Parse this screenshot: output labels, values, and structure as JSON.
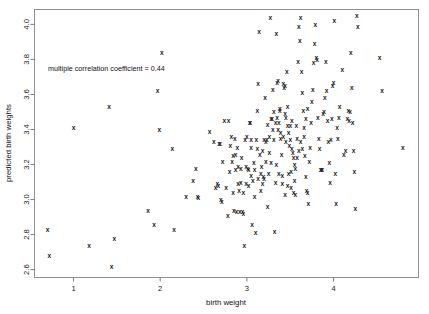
{
  "chart_data": {
    "type": "scatter",
    "title": "",
    "xlabel": "birth weight",
    "ylabel": "predicted birth weights",
    "xlim": [
      0.55,
      4.98
    ],
    "ylim": [
      2.555,
      4.085
    ],
    "xticks": [
      1,
      2,
      3,
      4
    ],
    "xtick_labels": [
      "1",
      "2",
      "3",
      "4"
    ],
    "yticks": [
      2.6,
      2.8,
      3.0,
      3.2,
      3.4,
      3.6,
      3.8,
      4.0
    ],
    "ytick_labels": [
      "2.6",
      "2.8",
      "3.0",
      "3.2",
      "3.4",
      "3.6",
      "3.8",
      "4.0"
    ],
    "grid": false,
    "legend": null,
    "marker": "x",
    "marker_color": "#1c1c1c",
    "frame_color": "#909090",
    "background": "#ffffff",
    "annotations": [
      {
        "text": "multiple correlation coefficient = 0.44",
        "x": 0.74,
        "y": 3.79,
        "align": "left"
      }
    ],
    "statistics": {
      "multiple_correlation_coefficient": 0.44,
      "n_points": 222
    },
    "points": [
      [
        0.7,
        2.83
      ],
      [
        0.72,
        2.68
      ],
      [
        1.0,
        3.41
      ],
      [
        1.18,
        2.74
      ],
      [
        1.41,
        3.53
      ],
      [
        1.44,
        2.62
      ],
      [
        1.47,
        2.78
      ],
      [
        1.86,
        2.94
      ],
      [
        1.93,
        2.86
      ],
      [
        1.97,
        3.62
      ],
      [
        1.99,
        3.4
      ],
      [
        2.02,
        3.84
      ],
      [
        2.14,
        3.29
      ],
      [
        2.16,
        2.83
      ],
      [
        2.3,
        3.02
      ],
      [
        2.38,
        3.11
      ],
      [
        2.41,
        3.18
      ],
      [
        2.43,
        3.02
      ],
      [
        2.44,
        3.01
      ],
      [
        2.57,
        3.39
      ],
      [
        2.62,
        3.33
      ],
      [
        2.64,
        3.07
      ],
      [
        2.66,
        3.09
      ],
      [
        2.67,
        3.08
      ],
      [
        2.68,
        3.32
      ],
      [
        2.69,
        3.32
      ],
      [
        2.7,
        3.0
      ],
      [
        2.71,
        2.99
      ],
      [
        2.72,
        3.22
      ],
      [
        2.74,
        3.45
      ],
      [
        2.76,
        3.07
      ],
      [
        2.78,
        2.91
      ],
      [
        2.79,
        3.45
      ],
      [
        2.8,
        3.16
      ],
      [
        2.82,
        3.36
      ],
      [
        2.83,
        3.22
      ],
      [
        2.84,
        3.04
      ],
      [
        2.85,
        2.94
      ],
      [
        2.86,
        3.35
      ],
      [
        2.87,
        3.26
      ],
      [
        2.88,
        2.93
      ],
      [
        2.89,
        3.3
      ],
      [
        2.9,
        3.09
      ],
      [
        2.91,
        3.05
      ],
      [
        2.92,
        2.93
      ],
      [
        2.93,
        3.18
      ],
      [
        2.94,
        3.24
      ],
      [
        2.95,
        2.93
      ],
      [
        2.96,
        2.92
      ],
      [
        2.97,
        2.74
      ],
      [
        2.98,
        3.34
      ],
      [
        2.99,
        3.19
      ],
      [
        3.0,
        3.36
      ],
      [
        3.01,
        3.18
      ],
      [
        3.02,
        3.08
      ],
      [
        3.03,
        3.44
      ],
      [
        3.04,
        3.44
      ],
      [
        3.05,
        3.34
      ],
      [
        3.06,
        2.86
      ],
      [
        3.07,
        3.11
      ],
      [
        3.08,
        3.21
      ],
      [
        3.09,
        3.02
      ],
      [
        3.1,
        2.81
      ],
      [
        3.11,
        3.34
      ],
      [
        3.12,
        3.51
      ],
      [
        3.13,
        3.66
      ],
      [
        3.14,
        3.96
      ],
      [
        3.15,
        3.26
      ],
      [
        3.16,
        3.15
      ],
      [
        3.17,
        3.19
      ],
      [
        3.18,
        3.09
      ],
      [
        3.19,
        3.13
      ],
      [
        3.2,
        3.34
      ],
      [
        3.21,
        3.58
      ],
      [
        3.22,
        3.33
      ],
      [
        3.23,
        3.34
      ],
      [
        3.24,
        2.96
      ],
      [
        3.25,
        3.15
      ],
      [
        3.26,
        3.27
      ],
      [
        3.27,
        4.04
      ],
      [
        3.28,
        3.21
      ],
      [
        3.29,
        3.46
      ],
      [
        3.3,
        3.63
      ],
      [
        3.31,
        3.34
      ],
      [
        3.32,
        2.82
      ],
      [
        3.33,
        3.1
      ],
      [
        3.34,
        3.95
      ],
      [
        3.35,
        3.67
      ],
      [
        3.36,
        3.68
      ],
      [
        3.37,
        3.44
      ],
      [
        3.38,
        3.51
      ],
      [
        3.39,
        3.35
      ],
      [
        3.4,
        3.26
      ],
      [
        3.41,
        3.14
      ],
      [
        3.42,
        3.66
      ],
      [
        3.43,
        3.64
      ],
      [
        3.44,
        3.65
      ],
      [
        3.45,
        3.47
      ],
      [
        3.46,
        3.73
      ],
      [
        3.47,
        3.42
      ],
      [
        3.48,
        3.15
      ],
      [
        3.49,
        3.31
      ],
      [
        3.5,
        3.34
      ],
      [
        3.51,
        3.07
      ],
      [
        3.52,
        3.45
      ],
      [
        3.53,
        3.27
      ],
      [
        3.54,
        3.04
      ],
      [
        3.55,
        3.2
      ],
      [
        3.56,
        3.03
      ],
      [
        3.57,
        3.42
      ],
      [
        3.58,
        3.35
      ],
      [
        3.59,
        3.79
      ],
      [
        3.6,
        3.99
      ],
      [
        3.61,
        3.91
      ],
      [
        3.62,
        4.04
      ],
      [
        3.63,
        3.73
      ],
      [
        3.64,
        3.61
      ],
      [
        3.65,
        3.51
      ],
      [
        3.66,
        3.41
      ],
      [
        3.67,
        3.25
      ],
      [
        3.68,
        3.13
      ],
      [
        3.69,
        3.05
      ],
      [
        3.7,
        3.04
      ],
      [
        3.71,
        2.98
      ],
      [
        3.72,
        3.22
      ],
      [
        3.73,
        3.3
      ],
      [
        3.74,
        3.44
      ],
      [
        3.75,
        3.56
      ],
      [
        3.76,
        3.63
      ],
      [
        3.77,
        3.78
      ],
      [
        3.78,
        3.89
      ],
      [
        3.79,
        4.0
      ],
      [
        3.8,
        3.81
      ],
      [
        3.81,
        3.8
      ],
      [
        3.82,
        3.47
      ],
      [
        3.83,
        3.35
      ],
      [
        3.84,
        3.29
      ],
      [
        3.85,
        3.17
      ],
      [
        3.86,
        3.17
      ],
      [
        3.87,
        3.17
      ],
      [
        3.88,
        3.49
      ],
      [
        3.89,
        3.5
      ],
      [
        3.9,
        3.58
      ],
      [
        3.91,
        3.79
      ],
      [
        3.92,
        3.62
      ],
      [
        3.93,
        3.45
      ],
      [
        3.94,
        3.33
      ],
      [
        3.95,
        3.21
      ],
      [
        3.96,
        3.1
      ],
      [
        3.97,
        3.34
      ],
      [
        3.98,
        3.46
      ],
      [
        3.99,
        3.65
      ],
      [
        4.0,
        3.67
      ],
      [
        4.01,
        4.02
      ],
      [
        4.02,
        3.15
      ],
      [
        4.03,
        2.98
      ],
      [
        4.04,
        3.41
      ],
      [
        4.05,
        3.35
      ],
      [
        4.06,
        3.47
      ],
      [
        4.07,
        3.53
      ],
      [
        4.1,
        3.74
      ],
      [
        4.12,
        3.26
      ],
      [
        4.14,
        3.28
      ],
      [
        4.16,
        3.46
      ],
      [
        4.17,
        3.51
      ],
      [
        4.18,
        3.45
      ],
      [
        4.19,
        3.5
      ],
      [
        4.2,
        3.84
      ],
      [
        4.21,
        3.64
      ],
      [
        4.22,
        3.44
      ],
      [
        4.23,
        3.28
      ],
      [
        4.24,
        3.16
      ],
      [
        4.25,
        2.95
      ],
      [
        4.27,
        4.05
      ],
      [
        4.28,
        3.99
      ],
      [
        4.53,
        3.81
      ],
      [
        4.56,
        3.62
      ],
      [
        4.8,
        3.3
      ],
      [
        3.05,
        3.3
      ],
      [
        3.12,
        3.29
      ],
      [
        3.18,
        3.28
      ],
      [
        3.22,
        3.22
      ],
      [
        3.26,
        3.36
      ],
      [
        3.3,
        3.4
      ],
      [
        3.33,
        3.44
      ],
      [
        3.36,
        3.4
      ],
      [
        3.39,
        3.38
      ],
      [
        3.42,
        3.36
      ],
      [
        3.45,
        3.33
      ],
      [
        3.48,
        3.38
      ],
      [
        3.5,
        3.42
      ],
      [
        3.52,
        3.29
      ],
      [
        3.54,
        3.24
      ],
      [
        3.56,
        3.18
      ],
      [
        3.58,
        3.24
      ],
      [
        3.6,
        3.28
      ],
      [
        3.62,
        3.33
      ],
      [
        3.64,
        3.29
      ],
      [
        3.66,
        3.36
      ],
      [
        3.68,
        3.46
      ],
      [
        3.7,
        3.52
      ],
      [
        3.44,
        3.49
      ],
      [
        3.47,
        3.53
      ],
      [
        3.38,
        3.52
      ],
      [
        3.35,
        3.47
      ],
      [
        3.31,
        3.5
      ],
      [
        3.28,
        3.46
      ],
      [
        3.24,
        3.43
      ],
      [
        3.2,
        3.12
      ],
      [
        3.16,
        3.05
      ],
      [
        3.13,
        3.12
      ],
      [
        3.09,
        3.17
      ],
      [
        3.05,
        3.14
      ],
      [
        3.02,
        3.17
      ],
      [
        2.99,
        3.09
      ],
      [
        2.96,
        3.04
      ],
      [
        3.34,
        3.2
      ],
      [
        3.37,
        3.15
      ],
      [
        3.41,
        3.09
      ],
      [
        3.44,
        3.03
      ],
      [
        3.47,
        3.08
      ],
      [
        3.51,
        3.16
      ],
      [
        3.55,
        3.11
      ],
      [
        2.93,
        3.1
      ],
      [
        2.9,
        3.19
      ],
      [
        2.87,
        3.17
      ],
      [
        2.84,
        3.25
      ],
      [
        2.81,
        3.31
      ]
    ]
  },
  "axes": {
    "x_axis_name": "birth weight",
    "y_axis_name": "predicted birth weights"
  },
  "annotation": {
    "correlation_text": "multiple correlation coefficient = 0.44"
  }
}
